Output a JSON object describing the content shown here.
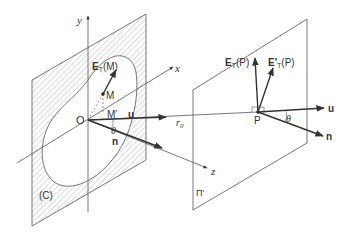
{
  "figure": {
    "colors": {
      "line": "#555555",
      "arrow": "#333333",
      "hatch": "#9a9a9a",
      "text": "#333333",
      "background": "#ffffff"
    }
  },
  "labels": {
    "y_axis": "y",
    "x_axis": "x",
    "z_axis": "z",
    "origin": "O",
    "point_M": "M",
    "point_M_prime": "M′",
    "E_T_M_main": "E",
    "E_T_M_sub": "T",
    "E_T_M_arg": "(M)",
    "u_left": "u",
    "n_left": "n",
    "theta_left": "θ",
    "r0": "r",
    "r0_sub": "0",
    "contour": "(C)",
    "plane_pi": "Π′",
    "point_P": "P",
    "E_T_P_main": "E",
    "E_T_P_sub": "T",
    "E_T_P_arg": "(P)",
    "E_prime_T_P_main": "E′",
    "E_prime_T_P_sub": "T",
    "E_prime_T_P_arg": "(P)",
    "u_right": "u",
    "n_right": "n",
    "theta_right": "θ"
  }
}
